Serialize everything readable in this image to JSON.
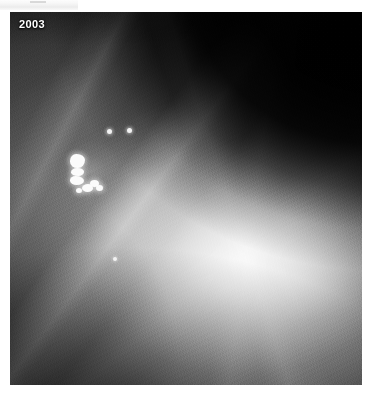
{
  "page": {
    "background_color": "#ffffff",
    "width": 372,
    "height": 400
  },
  "watermark": {
    "name": "watermark-strip",
    "caption": ""
  },
  "figure": {
    "type": "mammogram",
    "modality": "x-ray-mammography",
    "colors": {
      "film_black": "#030303",
      "tissue_mid_gray": "#6e6e6e",
      "dense_tissue": "#d8d8d8",
      "calcification_white": "#fbfbfb",
      "label_text": "#ffffff"
    },
    "year_label": "2003",
    "frame": {
      "left": 10,
      "top": 12,
      "width": 352,
      "height": 373
    },
    "regions": [
      {
        "name": "air-background-upper-right",
        "description": "black air gap outside breast tissue"
      },
      {
        "name": "fibroglandular-tissue",
        "description": "mottled gray parenchyma filling most of the field"
      },
      {
        "name": "dense-core",
        "description": "bright dense glandular region centre-right"
      },
      {
        "name": "diagonal-tissue-band",
        "description": "bright diagonal fibrous band upper-left to lower-right"
      }
    ],
    "findings": [
      {
        "name": "calcification-cluster",
        "label": "clustered microcalcifications",
        "x": 48,
        "y": 128,
        "width": 64,
        "height": 62
      },
      {
        "name": "calcification-dot-upper-right",
        "x": 97,
        "y": 117,
        "size": 5
      },
      {
        "name": "calcification-dot-upper-far-right",
        "x": 117,
        "y": 116,
        "size": 5
      },
      {
        "name": "calcification-dot-lower",
        "x": 103,
        "y": 245,
        "size": 4
      }
    ]
  }
}
